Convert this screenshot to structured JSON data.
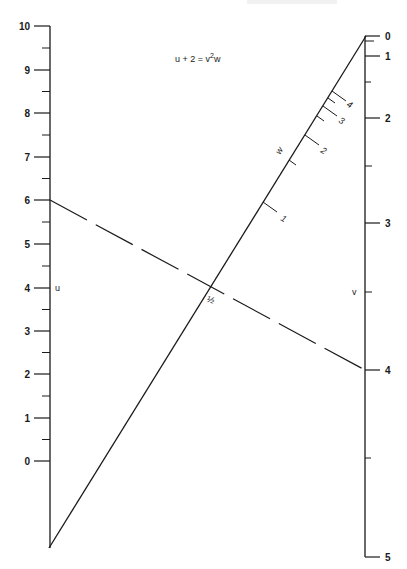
{
  "title_parts": {
    "lhs": "u + 2 = v",
    "sup": "2",
    "rhs": "w"
  },
  "scales": {
    "u": {
      "name": "u",
      "major_ticks": [
        {
          "label": "10",
          "y": 26
        },
        {
          "label": "9",
          "y": 70
        },
        {
          "label": "8",
          "y": 113
        },
        {
          "label": "7",
          "y": 157
        },
        {
          "label": "6",
          "y": 200
        },
        {
          "label": "5",
          "y": 244
        },
        {
          "label": "4",
          "y": 288
        },
        {
          "label": "3",
          "y": 331
        },
        {
          "label": "2",
          "y": 374
        },
        {
          "label": "1",
          "y": 418
        },
        {
          "label": "0",
          "y": 461
        }
      ]
    },
    "v": {
      "name": "v",
      "major_ticks": [
        {
          "label": "0",
          "y": 36
        },
        {
          "label": "1",
          "y": 56
        },
        {
          "label": "2",
          "y": 118
        },
        {
          "label": "3",
          "y": 223
        },
        {
          "label": "4",
          "y": 370
        },
        {
          "label": "5",
          "y": 557
        }
      ]
    },
    "w": {
      "name": "w",
      "major_ticks": [
        {
          "label": "1"
        },
        {
          "label": "2"
        },
        {
          "label": "3"
        },
        {
          "label": "4"
        }
      ],
      "intersection_label": "½"
    }
  },
  "example_isopleth": {
    "u_value": "6",
    "w_value": "½",
    "v_value": "4"
  }
}
